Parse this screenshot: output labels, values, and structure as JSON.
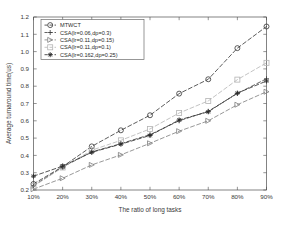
{
  "chart_data": {
    "type": "line",
    "title": "",
    "xlabel": "The ratio of long tasks",
    "ylabel": "Average turnaround time(us)",
    "categories": [
      "10%",
      "20%",
      "30%",
      "40%",
      "50%",
      "60%",
      "70%",
      "80%",
      "90%"
    ],
    "x": [
      10,
      20,
      30,
      40,
      50,
      60,
      70,
      80,
      90
    ],
    "xlim": [
      10,
      90
    ],
    "ylim": [
      0.2,
      1.2
    ],
    "yticks": [
      "0.2",
      "0.3",
      "0.4",
      "0.5",
      "0.6",
      "0.7",
      "0.8",
      "0.9",
      "1.0",
      "1.1",
      "1.2"
    ],
    "ytick_values": [
      0.2,
      0.3,
      0.4,
      0.5,
      0.6,
      0.7,
      0.8,
      0.9,
      1.0,
      1.1,
      1.2
    ],
    "grid": false,
    "legend_position": "top-left",
    "series": [
      {
        "name": "MTWCT",
        "marker": "circle",
        "color": "#333333",
        "values": [
          0.235,
          0.335,
          0.452,
          0.545,
          0.632,
          0.757,
          0.84,
          1.02,
          1.145
        ]
      },
      {
        "name": "CSA(lr=0.06,dp=0.3)",
        "marker": "plus",
        "color": "#3a3a3a",
        "values": [
          0.225,
          0.333,
          0.42,
          0.468,
          0.52,
          0.6,
          0.655,
          0.758,
          0.843
        ]
      },
      {
        "name": "CSA(lr=0.11,dp=0.15)",
        "marker": "tri-right",
        "color": "#7d7d7d",
        "values": [
          0.205,
          0.268,
          0.345,
          0.403,
          0.47,
          0.54,
          0.6,
          0.693,
          0.768
        ]
      },
      {
        "name": "CSA(lr=0.11,dp=0.1)",
        "marker": "square",
        "color": "#b4b4b4",
        "values": [
          0.222,
          0.33,
          0.43,
          0.487,
          0.553,
          0.645,
          0.715,
          0.838,
          0.935
        ]
      },
      {
        "name": "CSA(lr=0.162,dp=0.25)",
        "marker": "star",
        "color": "#2b2b2b",
        "values": [
          0.28,
          0.338,
          0.418,
          0.465,
          0.515,
          0.605,
          0.652,
          0.76,
          0.83
        ]
      }
    ]
  },
  "legend": {
    "items": [
      {
        "label": "MTWCT"
      },
      {
        "label": "CSA(lr=0.06,dp=0.3)"
      },
      {
        "label": "CSA(lr=0.11,dp=0.15)"
      },
      {
        "label": "CSA(lr=0.11,dp=0.1)"
      },
      {
        "label": "CSA(lr=0.162,dp=0.25)"
      }
    ]
  }
}
